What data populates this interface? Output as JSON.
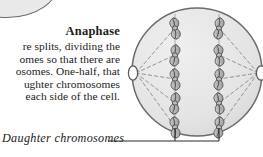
{
  "figure": {
    "heading": "Anaphase",
    "body_lines": [
      "re splits, dividing the",
      "omes so that there are",
      "osomes. One-half, that",
      "ughter chromosomes",
      "each side of the cell."
    ],
    "caption": "Daughter chromosomes"
  },
  "colors": {
    "cell_fill": "#e4e4e4",
    "cell_stroke": "#6b6b6b",
    "chromosome_fill": "#b9b9b9",
    "chromosome_stroke": "#4a4a4a",
    "spindle_stroke": "#8a8a8a",
    "pole_fill": "#ffffff",
    "leader_stroke": "#2b2b2b",
    "text": "#1c1c1c",
    "background": "#ffffff"
  },
  "diagram": {
    "label": "anaphase-cell-diagram",
    "cell": {
      "cx": 197,
      "cy": 72,
      "rx": 65,
      "ry": 64
    },
    "poles": [
      {
        "name": "left-spindle-pole",
        "cx": 133,
        "cy": 73,
        "rx": 4.6,
        "ry": 7.2
      },
      {
        "name": "right-spindle-pole",
        "cx": 261,
        "cy": 73,
        "rx": 4.6,
        "ry": 7.2
      }
    ],
    "chromosome_columns": [
      {
        "name": "left-chromatid-column",
        "x": 175,
        "count": 5
      },
      {
        "name": "right-chromatid-column",
        "x": 219,
        "count": 5
      }
    ],
    "chromosome_rows_y": [
      28,
      55,
      79,
      103,
      127
    ],
    "spindle_fiber_count": 10,
    "leader": {
      "y": 141,
      "x_start": 108,
      "x_end": 219,
      "risers_x": [
        175,
        219
      ],
      "riser_top": 128
    }
  }
}
